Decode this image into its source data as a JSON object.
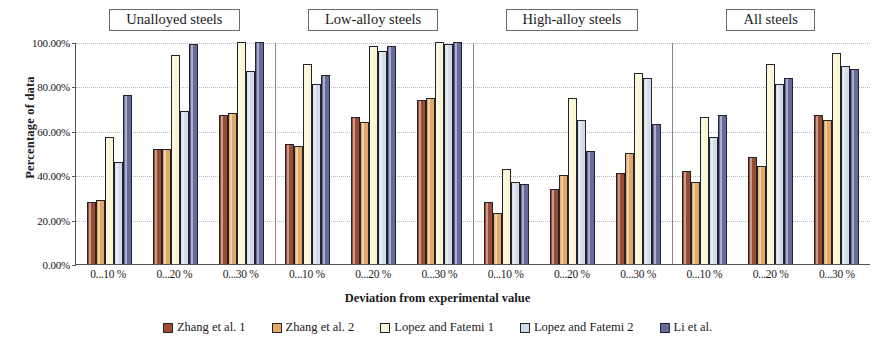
{
  "chart_data": {
    "type": "bar",
    "title": "",
    "xlabel": "Deviation from experimental value",
    "ylabel": "Percentage of data",
    "ylim": [
      0,
      100
    ],
    "yticks": [
      "0.00%",
      "20.00%",
      "40.00%",
      "60.00%",
      "80.00%",
      "100.00%"
    ],
    "ytick_values": [
      0,
      20,
      40,
      60,
      80,
      100
    ],
    "grid": true,
    "legend_position": "bottom",
    "categories": [
      "0...10 %",
      "0...20 %",
      "0...30 %"
    ],
    "group_labels": [
      "Unalloyed steels",
      "Low-alloy steels",
      "High-alloy steels",
      "All steels"
    ],
    "series": [
      {
        "name": "Zhang et al. 1",
        "color": "#9B4B32"
      },
      {
        "name": "Zhang et al. 2",
        "color": "#E2A866"
      },
      {
        "name": "Lopez and Fatemi 1",
        "color": "#FAF5D2"
      },
      {
        "name": "Lopez and Fatemi 2",
        "color": "#D3DCEA"
      },
      {
        "name": "Li et al.",
        "color": "#656C9B"
      }
    ],
    "groups": [
      {
        "label": "Unalloyed steels",
        "clusters": [
          {
            "category": "0...10 %",
            "values": [
              28,
              29,
              57,
              46,
              76
            ]
          },
          {
            "category": "0...20 %",
            "values": [
              52,
              52,
              94,
              69,
              99
            ]
          },
          {
            "category": "0...30 %",
            "values": [
              67,
              68,
              100,
              87,
              100
            ]
          }
        ]
      },
      {
        "label": "Low-alloy steels",
        "clusters": [
          {
            "category": "0...10 %",
            "values": [
              54,
              53,
              90,
              81,
              85
            ]
          },
          {
            "category": "0...20 %",
            "values": [
              66,
              64,
              98,
              96,
              98
            ]
          },
          {
            "category": "0...30 %",
            "values": [
              74,
              75,
              100,
              99,
              100
            ]
          }
        ]
      },
      {
        "label": "High-alloy steels",
        "clusters": [
          {
            "category": "0...10 %",
            "values": [
              28,
              23,
              43,
              37,
              36
            ]
          },
          {
            "category": "0...20 %",
            "values": [
              34,
              40,
              75,
              65,
              51
            ]
          },
          {
            "category": "0...30 %",
            "values": [
              41,
              50,
              86,
              84,
              63
            ]
          }
        ]
      },
      {
        "label": "All steels",
        "clusters": [
          {
            "category": "0...10 %",
            "values": [
              42,
              37,
              66,
              57,
              67
            ]
          },
          {
            "category": "0...20 %",
            "values": [
              48,
              44,
              90,
              81,
              84
            ]
          },
          {
            "category": "0...30 %",
            "values": [
              67,
              65,
              95,
              89,
              88
            ]
          }
        ]
      }
    ]
  }
}
